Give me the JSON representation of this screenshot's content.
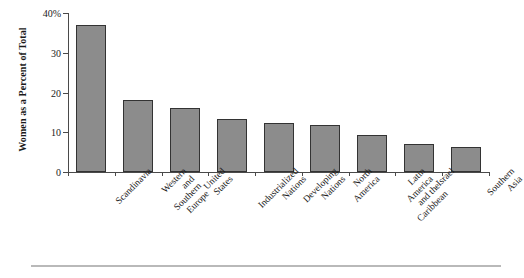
{
  "chart_data": {
    "type": "bar",
    "title": "",
    "xlabel": "",
    "ylabel": "Women as a Percent of Total",
    "ylim": [
      0,
      40
    ],
    "grid": false,
    "legend": false,
    "y_tick_labels": [
      "40%",
      "30",
      "20",
      "10",
      "0"
    ],
    "y_tick_values": [
      40,
      30,
      20,
      10,
      0
    ],
    "categories": [
      "Scandinavia",
      "Western and\nSouthern Europe",
      "United States",
      "Industrialized Nations",
      "Developing Nations",
      "North America",
      "Latin America\nand the Caribbean",
      "Israel",
      "Southern Asia"
    ],
    "values": [
      37,
      18,
      16,
      13.3,
      12.4,
      11.8,
      9.2,
      7,
      6.3
    ],
    "bar_color": "#8c8c8c",
    "bar_edge_color": "#333333",
    "axis_color": "#4a4a4a",
    "background_color": "#ffffff"
  }
}
